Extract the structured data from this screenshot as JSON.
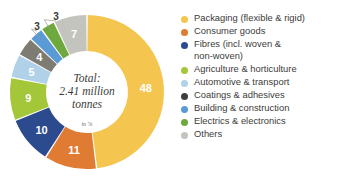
{
  "chart_data": {
    "type": "pie",
    "variant": "donut",
    "title": "",
    "subtitle": "",
    "unit_note": "in %",
    "center_label_lines": [
      "Total:",
      "2.41 million",
      "tonnes"
    ],
    "total_text": "Total: 2.41 million tonnes",
    "xlabel": "",
    "ylabel": "",
    "legend_position": "right",
    "grid": false,
    "categories": [
      "Packaging (flexible & rigid)",
      "Consumer goods",
      "Fibres (incl. woven &\nnon-woven)",
      "Agriculture & horticulture",
      "Automotive & transport",
      "Coatings & adhesives",
      "Building & construction",
      "Electrics & electronics",
      "Others"
    ],
    "values": [
      48,
      11,
      10,
      9,
      5,
      4,
      3,
      3,
      7
    ],
    "value_labels": [
      "48",
      "11",
      "10",
      "9",
      "5",
      "4",
      "3",
      "3",
      "7"
    ],
    "colors": [
      "#F5C64F",
      "#E07B34",
      "#2C4A8E",
      "#A4C639",
      "#B0D1E8",
      "#7E7B73",
      "#5B9BD5",
      "#6FA83C",
      "#C3C4BD"
    ]
  },
  "legend": {
    "items": [
      {
        "label": "Packaging (flexible & rigid)",
        "color": "#F5C64F"
      },
      {
        "label": "Consumer goods",
        "color": "#E07B34"
      },
      {
        "label": "Fibres (incl. woven &\nnon-woven)",
        "color": "#2C4A8E"
      },
      {
        "label": "Agriculture & horticulture",
        "color": "#A4C639"
      },
      {
        "label": "Automotive & transport",
        "color": "#B0D1E8"
      },
      {
        "label": "Coatings & adhesives",
        "color": "#3F3F3B"
      },
      {
        "label": "Building & construction",
        "color": "#5B9BD5"
      },
      {
        "label": "Electrics & electronics",
        "color": "#6FA83C"
      },
      {
        "label": "Others",
        "color": "#C3C4BD"
      }
    ]
  }
}
